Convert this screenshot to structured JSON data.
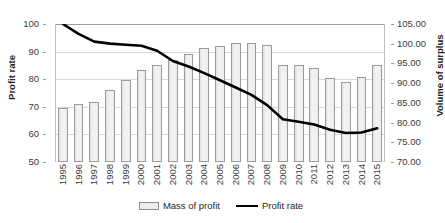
{
  "chart_data": {
    "type": "bar",
    "title": "",
    "xlabel": "",
    "categories": [
      "1995",
      "1996",
      "1997",
      "1998",
      "1999",
      "2000",
      "2001",
      "2002",
      "2003",
      "2004",
      "2005",
      "2006",
      "2007",
      "2008",
      "2009",
      "2010",
      "2011",
      "2012",
      "2013",
      "2014",
      "2015"
    ],
    "grid": true,
    "legend_position": "bottom",
    "series": [
      {
        "name": "Mass of profit",
        "type": "bar",
        "axis": "right",
        "ylabel": "Volume of surplus",
        "ylim": [
          70.0,
          105.0
        ],
        "yticks": [
          "70.00",
          "75.00",
          "80.00",
          "85.00",
          "90.00",
          "95.00",
          "100.00",
          "105.00"
        ],
        "color": "#ededed",
        "edge_color": "#9a9a9a",
        "values": [
          83.8,
          84.8,
          85.2,
          88.3,
          90.7,
          93.4,
          94.5,
          96.0,
          97.4,
          98.8,
          99.5,
          100.2,
          100.2,
          99.6,
          94.7,
          94.6,
          93.8,
          91.3,
          90.3,
          91.5,
          94.5
        ]
      },
      {
        "name": "Profit rate",
        "type": "line",
        "axis": "left",
        "ylabel": "Profit rate",
        "ylim": [
          50,
          100
        ],
        "yticks": [
          "50",
          "60",
          "70",
          "80",
          "90",
          "100"
        ],
        "color": "#000000",
        "values": [
          100.0,
          96.4,
          93.6,
          92.9,
          92.5,
          92.1,
          90.3,
          86.6,
          84.6,
          82.2,
          79.6,
          77.0,
          74.3,
          70.6,
          65.5,
          64.6,
          63.6,
          61.7,
          60.5,
          60.7,
          62.2
        ]
      }
    ]
  },
  "axes": {
    "left": {
      "title": "Profit rate",
      "ticks": [
        "100",
        "90",
        "80",
        "70",
        "60",
        "50"
      ],
      "min": 50,
      "max": 100
    },
    "right": {
      "title": "Volume of surplus",
      "ticks": [
        "105.00",
        "100.00",
        "95.00",
        "90.00",
        "85.00",
        "80.00",
        "75.00",
        "70.00"
      ],
      "min": 70,
      "max": 105
    },
    "bottom": {
      "ticks": [
        "1995",
        "1996",
        "1997",
        "1998",
        "1999",
        "2000",
        "2001",
        "2002",
        "2003",
        "2004",
        "2005",
        "2006",
        "2007",
        "2008",
        "2009",
        "2010",
        "2011",
        "2012",
        "2013",
        "2014",
        "2015"
      ]
    }
  },
  "legend": {
    "items": [
      {
        "label": "Mass of profit",
        "marker": "bar-swatch",
        "color": "#ededed"
      },
      {
        "label": "Profit rate",
        "marker": "line-swatch",
        "color": "#000000"
      }
    ]
  }
}
